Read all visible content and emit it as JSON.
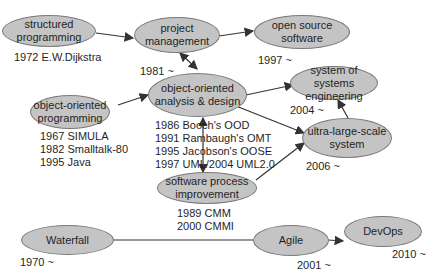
{
  "nodes": {
    "structured": {
      "label": "structured programming",
      "note": "1972 E.W.Dijkstra"
    },
    "project": {
      "label": "project management",
      "note": "1981 ~"
    },
    "opensource": {
      "label": "open source software",
      "note": "1997 ~"
    },
    "oop": {
      "label": "object-oriented programming",
      "notes": [
        "1967 SIMULA",
        "1982 Smalltalk-80",
        "1995 Java"
      ]
    },
    "ooad": {
      "label": "object-oriented analysis & design",
      "notes": [
        "1986 Booch's OOD",
        "1991 Rambaugh's OMT",
        "1995 Jacobson's OOSE",
        "1997 UML/2004 UML2.0"
      ]
    },
    "sos": {
      "label": "system of systems engineering",
      "note": "2004 ~"
    },
    "uls": {
      "label": "ultra-large-scale system",
      "note": "2006 ~"
    },
    "spi": {
      "label": "software process improvement",
      "notes": [
        "1989 CMM",
        "2000 CMMI"
      ]
    },
    "waterfall": {
      "label": "Waterfall",
      "note": "1970 ~"
    },
    "agile": {
      "label": "Agile",
      "note": "2001 ~"
    },
    "devops": {
      "label": "DevOps",
      "note": "2010 ~"
    }
  },
  "colors": {
    "node_fill": "#c4c4c4",
    "node_border": "#7a7a7a",
    "edge": "#333333"
  }
}
